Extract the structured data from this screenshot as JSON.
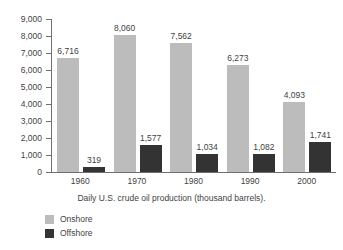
{
  "chart_data": {
    "type": "bar",
    "title": "",
    "caption": "Daily U.S. crude oil production (thousand barrels).",
    "xlabel": "",
    "ylabel": "",
    "categories": [
      "1960",
      "1970",
      "1980",
      "1990",
      "2000"
    ],
    "series": [
      {
        "name": "Onshore",
        "color": "#bcbcbc",
        "values": [
          6716,
          8060,
          7562,
          6273,
          4093
        ],
        "labels": [
          "6,716",
          "8,060",
          "7,562",
          "6,273",
          "4,093"
        ]
      },
      {
        "name": "Offshore",
        "color": "#333333",
        "values": [
          319,
          1577,
          1034,
          1082,
          1741
        ],
        "labels": [
          "319",
          "1,577",
          "1,034",
          "1,082",
          "1,741"
        ]
      }
    ],
    "ylim": [
      0,
      9000
    ],
    "ytick_values": [
      9000,
      8000,
      7000,
      6000,
      5000,
      4000,
      3000,
      2000,
      1000,
      0
    ],
    "ytick_labels": [
      "9,000",
      "8,000",
      "7,000",
      "6,000",
      "5,000",
      "4,000",
      "3,000",
      "2,000",
      "1,000",
      "0"
    ],
    "grid": false,
    "legend_position": "bottom-left"
  },
  "legend": {
    "items": [
      {
        "label": "Onshore",
        "color": "#bcbcbc"
      },
      {
        "label": "Offshore",
        "color": "#333333"
      }
    ]
  }
}
